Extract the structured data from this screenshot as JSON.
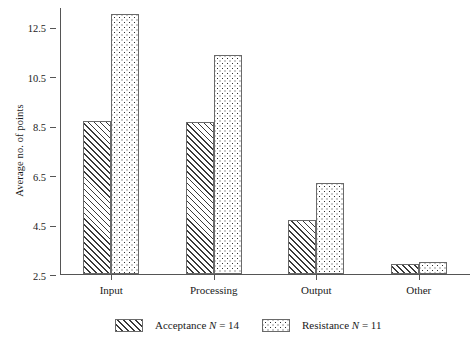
{
  "chart_data": {
    "type": "bar",
    "title": "",
    "subtitle": "",
    "xlabel": "",
    "ylabel": "Average no. of points",
    "categories": [
      "Input",
      "Processing",
      "Output",
      "Other"
    ],
    "series": [
      {
        "name": "Acceptance",
        "n": 14,
        "pattern": "diagonal-hatch",
        "values": [
          8.7,
          8.65,
          4.7,
          2.9
        ]
      },
      {
        "name": "Resistance",
        "n": 11,
        "pattern": "dotted",
        "values": [
          13.0,
          11.35,
          6.2,
          3.0
        ]
      }
    ],
    "yticks": [
      "2.5",
      "4.5",
      "6.5",
      "8.5",
      "10.5",
      "12.5"
    ],
    "ytick_values": [
      2.5,
      4.5,
      6.5,
      8.5,
      10.5,
      12.5
    ],
    "ylim": [
      2.5,
      13.3
    ],
    "grid": false,
    "legend_position": "bottom",
    "legend": [
      {
        "label": "Acceptance N = 14",
        "name": "Acceptance",
        "nlabel": "N",
        "nvalue": "= 14",
        "pattern": "diagonal-hatch"
      },
      {
        "label": "Resistance N = 11",
        "name": "Resistance",
        "nlabel": "N",
        "nvalue": "= 11",
        "pattern": "dotted"
      }
    ],
    "colors": {
      "axis": "#555555",
      "bar_outline": "#6a6a6a",
      "pattern_ink": "#2e2e2e",
      "background": "#ffffff"
    }
  }
}
